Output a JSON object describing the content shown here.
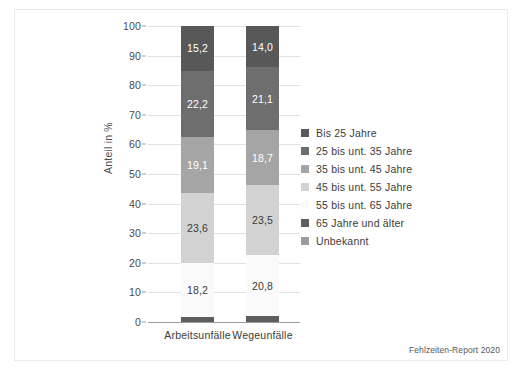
{
  "chart_data": {
    "type": "bar",
    "subtype": "stacked-100-percent",
    "title": "",
    "xlabel": "",
    "ylabel": "Anteil in %",
    "ylim": [
      0,
      100
    ],
    "yticks": [
      0,
      10,
      20,
      30,
      40,
      50,
      60,
      70,
      80,
      90,
      100
    ],
    "ytick_labels": [
      "0",
      "10",
      "20",
      "30",
      "40",
      "50",
      "60",
      "70",
      "80",
      "90",
      "100"
    ],
    "grid": true,
    "legend_position": "right",
    "categories": [
      "Arbeitsunfälle",
      "Wegeunfälle"
    ],
    "series": [
      {
        "name": "Bis 25 Jahre",
        "color": "#585858",
        "values": [
          15.2,
          14.0
        ],
        "labels": [
          "15,2",
          "14,0"
        ],
        "label_color": "light"
      },
      {
        "name": "25 bis unt. 35 Jahre",
        "color": "#6e6e6e",
        "values": [
          22.2,
          21.1
        ],
        "labels": [
          "22,2",
          "21,1"
        ],
        "label_color": "light"
      },
      {
        "name": "35 bis unt. 45 Jahre",
        "color": "#a5a5a5",
        "values": [
          19.1,
          18.7
        ],
        "labels": [
          "19,1",
          "18,7"
        ],
        "label_color": "light"
      },
      {
        "name": "45 bis unt. 55 Jahre",
        "color": "#d2d2d2",
        "values": [
          23.6,
          23.5
        ],
        "labels": [
          "23,6",
          "23,5"
        ],
        "label_color": "dark"
      },
      {
        "name": "55 bis unt. 65 Jahre",
        "color": "#fafafa",
        "values": [
          18.2,
          20.8
        ],
        "labels": [
          "18,2",
          "20,8"
        ],
        "label_color": "dark"
      },
      {
        "name": "65 Jahre und älter",
        "color": "#5e5e5e",
        "values": [
          1.7,
          1.9
        ],
        "labels": [
          "",
          ""
        ],
        "label_color": "none"
      },
      {
        "name": "Unbekannt",
        "color": "#9b9b9b",
        "values": [
          0.0,
          0.0
        ],
        "labels": [
          "",
          ""
        ],
        "label_color": "none"
      }
    ]
  },
  "source_note": "Fehlzeiten-Report 2020"
}
